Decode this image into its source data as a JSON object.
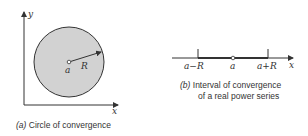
{
  "panel_a": {
    "caption_tag": "(a)",
    "caption": "Circle of convergence",
    "labels": {
      "y_axis": "y",
      "x_axis": "x",
      "center": "a",
      "radius": "R"
    },
    "colors": {
      "disk_fill": "#d2d2d2",
      "stroke": "#333333"
    }
  },
  "panel_b": {
    "caption_tag": "(b)",
    "caption_line1": "Interval of convergence",
    "caption_line2": "of a real power series",
    "labels": {
      "left": "a−R",
      "center": "a",
      "right": "a+R",
      "x_axis": "x"
    }
  }
}
